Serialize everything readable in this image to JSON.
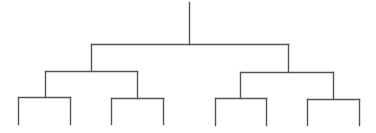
{
  "diagram": {
    "type": "binary-tree",
    "stroke_color": "#555555",
    "background": "#ffffff",
    "stroke_width": 1.4,
    "root": {
      "x": 189,
      "y_top": 2,
      "y_bottom": 44
    },
    "segments": [
      {
        "id": "root-stem",
        "x1": 189,
        "y1": 2,
        "x2": 189,
        "y2": 44
      },
      {
        "id": "level1-bar",
        "x1": 91,
        "y1": 44,
        "x2": 288,
        "y2": 44
      },
      {
        "id": "level1-left-drop",
        "x1": 91,
        "y1": 44,
        "x2": 91,
        "y2": 71
      },
      {
        "id": "level1-right-drop",
        "x1": 288,
        "y1": 44,
        "x2": 288,
        "y2": 72
      },
      {
        "id": "level2-left-bar",
        "x1": 45,
        "y1": 71,
        "x2": 137,
        "y2": 71
      },
      {
        "id": "level2-left-left-drop",
        "x1": 45,
        "y1": 71,
        "x2": 45,
        "y2": 97
      },
      {
        "id": "level2-left-right-drop",
        "x1": 137,
        "y1": 71,
        "x2": 137,
        "y2": 98
      },
      {
        "id": "level2-right-bar",
        "x1": 240,
        "y1": 72,
        "x2": 333,
        "y2": 72
      },
      {
        "id": "level2-right-left-drop",
        "x1": 240,
        "y1": 72,
        "x2": 240,
        "y2": 98
      },
      {
        "id": "level2-right-right-drop",
        "x1": 333,
        "y1": 72,
        "x2": 333,
        "y2": 99
      },
      {
        "id": "level3-bar-1",
        "x1": 18,
        "y1": 97,
        "x2": 70,
        "y2": 97
      },
      {
        "id": "level3-bar-2",
        "x1": 111,
        "y1": 98,
        "x2": 163,
        "y2": 98
      },
      {
        "id": "level3-bar-3",
        "x1": 215,
        "y1": 98,
        "x2": 266,
        "y2": 98
      },
      {
        "id": "level3-bar-4",
        "x1": 307,
        "y1": 99,
        "x2": 359,
        "y2": 99
      },
      {
        "id": "leaf-1",
        "x1": 18,
        "y1": 97,
        "x2": 18,
        "y2": 124
      },
      {
        "id": "leaf-2",
        "x1": 70,
        "y1": 97,
        "x2": 70,
        "y2": 124
      },
      {
        "id": "leaf-3",
        "x1": 111,
        "y1": 98,
        "x2": 111,
        "y2": 124
      },
      {
        "id": "leaf-4",
        "x1": 163,
        "y1": 98,
        "x2": 163,
        "y2": 124
      },
      {
        "id": "leaf-5",
        "x1": 215,
        "y1": 98,
        "x2": 215,
        "y2": 125
      },
      {
        "id": "leaf-6",
        "x1": 266,
        "y1": 98,
        "x2": 266,
        "y2": 125
      },
      {
        "id": "leaf-7",
        "x1": 307,
        "y1": 99,
        "x2": 307,
        "y2": 125
      },
      {
        "id": "leaf-8",
        "x1": 359,
        "y1": 99,
        "x2": 359,
        "y2": 125
      }
    ],
    "leaf_count": 8,
    "depth": 3
  }
}
